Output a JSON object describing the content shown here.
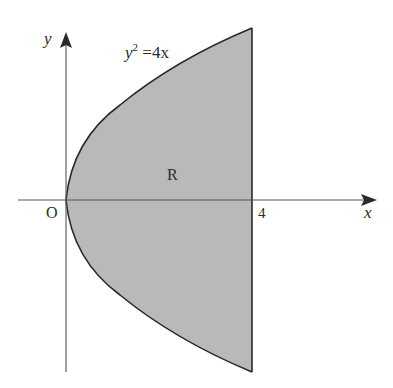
{
  "diagram": {
    "axes": {
      "x_label": "x",
      "y_label": "y",
      "origin_label": "O",
      "x_tick_label": "4"
    },
    "curve": {
      "equation_lhs_base": "y",
      "equation_lhs_exp": "2",
      "equation_rhs": " =4x",
      "equation": "y^2 = 4x"
    },
    "region": {
      "label": "R",
      "description": "Region bounded by y^2 = 4x and the line x = 4",
      "x_min": 0,
      "x_max": 4,
      "fill_color": "#b9b9b9",
      "stroke_color": "#2a2a2a"
    }
  }
}
